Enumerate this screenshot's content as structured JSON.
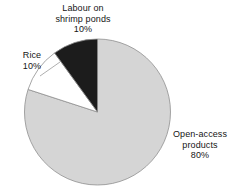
{
  "chart_data": {
    "type": "pie",
    "title": "",
    "subtitle": "",
    "xlabel": "",
    "ylabel": "",
    "legend_position": "none",
    "grid": false,
    "units": "percent",
    "total": 100,
    "start_angle_deg": 90,
    "direction": "counterclockwise",
    "categories": [
      "Labour on shrimp ponds",
      "Rice",
      "Open-access products"
    ],
    "values": [
      10,
      10,
      80
    ],
    "slices": [
      {
        "name": "Labour on shrimp ponds",
        "label_line1": "Labour on",
        "label_line2": "shrimp ponds",
        "value": 10,
        "value_text": "10%",
        "color": "#1c1c1c",
        "stroke": "#8f8f8f",
        "start_deg": 90,
        "end_deg": 126
      },
      {
        "name": "Rice",
        "label_line1": "Rice",
        "label_line2": "",
        "value": 10,
        "value_text": "10%",
        "color": "#ffffff",
        "stroke": "#8f8f8f",
        "start_deg": 126,
        "end_deg": 162
      },
      {
        "name": "Open-access products",
        "label_line1": "Open-access",
        "label_line2": "products",
        "value": 80,
        "value_text": "80%",
        "color": "#d5d5d5",
        "stroke": "#8f8f8f",
        "start_deg": 162,
        "end_deg": 450
      }
    ]
  },
  "figure": {
    "background_color": "#ffffff",
    "text_color": "#151515",
    "outline_color": "#8f8f8f"
  },
  "labels": {
    "labour": {
      "line1": "Labour on",
      "line2": "shrimp ponds",
      "line3": "10%"
    },
    "rice": {
      "line1": "Rice",
      "line2": "10%"
    },
    "open_access": {
      "line1": "Open-access",
      "line2": "products",
      "line3": "80%"
    }
  }
}
